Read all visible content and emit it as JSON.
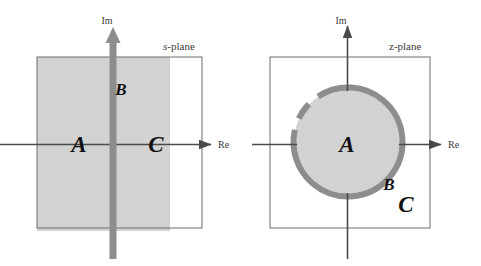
{
  "figure": {
    "width": 481,
    "height": 266,
    "background": "#ffffff"
  },
  "colors": {
    "region_fill": "#d2d2d2",
    "roc_boundary": "#8d8d8d",
    "axis": "#4a4a4a",
    "box_border": "#6e6e6e",
    "text": "#111111",
    "label_text": "#3a3a3a"
  },
  "panels": [
    {
      "id": "s-plane",
      "title_prefix": "s",
      "title_suffix": "-plane",
      "title_full": "s-plane",
      "axes": {
        "imaginary_label": "Im",
        "real_label": "Re"
      },
      "regions": [
        {
          "name": "A",
          "label": "A"
        },
        {
          "name": "B",
          "label": "B"
        },
        {
          "name": "C",
          "label": "C"
        }
      ]
    },
    {
      "id": "z-plane",
      "title_prefix": "z",
      "title_suffix": "-plane",
      "title_full": "z-plane",
      "axes": {
        "imaginary_label": "Im",
        "real_label": "Re"
      },
      "regions": [
        {
          "name": "A",
          "label": "A"
        },
        {
          "name": "B",
          "label": "B"
        },
        {
          "name": "C",
          "label": "C"
        }
      ]
    }
  ]
}
